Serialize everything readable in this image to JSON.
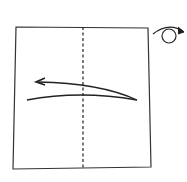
{
  "diagram": {
    "type": "origami-step",
    "paper": {
      "shape": "square",
      "corners": [
        [
          16,
          27
        ],
        [
          148,
          28
        ],
        [
          151,
          167
        ],
        [
          13,
          169
        ]
      ],
      "stroke": "#333333"
    },
    "fold_line": {
      "kind": "valley-fold-dashed",
      "x": 83,
      "y1": 27,
      "y2": 168,
      "stroke": "#222222"
    },
    "fold_arrow": {
      "direction": "right-to-left",
      "stroke": "#222222"
    },
    "turn_over_symbol": {
      "meaning": "turn-over",
      "stroke": "#222222"
    }
  }
}
